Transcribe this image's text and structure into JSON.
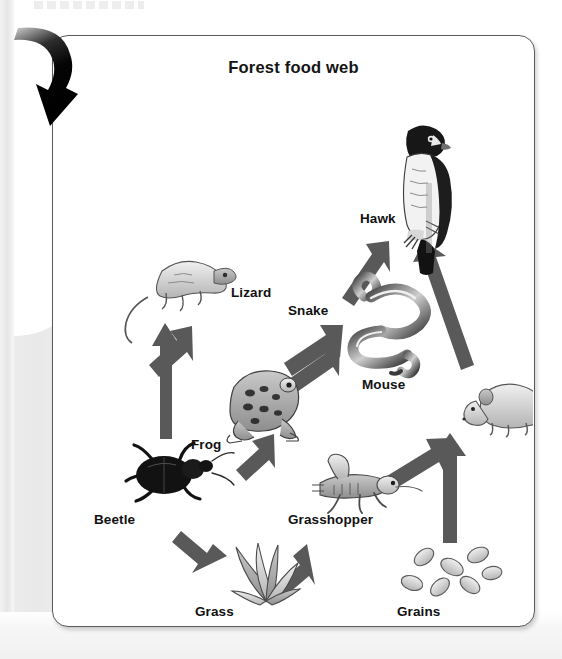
{
  "page": {
    "background_color": "#ffffff",
    "edge_shade_color": "#e9e9e9",
    "faint_header_text": ""
  },
  "annotation": {
    "arrow_name": "curved-callout-arrow",
    "color": "#0b0b0b",
    "direction": "down-right"
  },
  "card": {
    "title": "Forest food web",
    "border_color": "#5a5a5a",
    "background_color": "#ffffff"
  },
  "diagram": {
    "type": "food-web",
    "arrow_color": "#595959",
    "arrow_meaning": "energy flows in the direction of the arrow (eaten by)",
    "nodes": [
      {
        "id": "hawk",
        "label": "Hawk",
        "trophic": "tertiary consumer",
        "label_x": 308,
        "label_y": 183,
        "art_x": 348,
        "art_y": 92,
        "art_w": 66,
        "art_h": 122
      },
      {
        "id": "lizard",
        "label": "Lizard",
        "trophic": "secondary consumer",
        "label_x": 179,
        "label_y": 257,
        "art_x": 95,
        "art_y": 222,
        "art_w": 88,
        "art_h": 68
      },
      {
        "id": "snake",
        "label": "Snake",
        "trophic": "secondary consumer",
        "label_x": 258,
        "label_y": 275,
        "art_x": 300,
        "art_y": 252,
        "art_w": 84,
        "art_h": 86
      },
      {
        "id": "mouse",
        "label": "Mouse",
        "trophic": "primary consumer",
        "label_x": 362,
        "label_y": 349,
        "art_x": 414,
        "art_y": 338,
        "art_w": 84,
        "art_h": 62
      },
      {
        "id": "frog",
        "label": "Frog",
        "trophic": "secondary consumer",
        "label_x": 191,
        "label_y": 409,
        "art_x": 170,
        "art_y": 334,
        "art_w": 78,
        "art_h": 72
      },
      {
        "id": "beetle",
        "label": "Beetle",
        "trophic": "primary consumer",
        "label_x": 95,
        "label_y": 484,
        "art_x": 78,
        "art_y": 406,
        "art_w": 96,
        "art_h": 68
      },
      {
        "id": "grasshopper",
        "label": "Grasshopper",
        "trophic": "primary consumer",
        "label_x": 289,
        "label_y": 484,
        "art_x": 258,
        "art_y": 424,
        "art_w": 92,
        "art_h": 52
      },
      {
        "id": "grass",
        "label": "Grass",
        "trophic": "producer",
        "label_x": 196,
        "label_y": 576,
        "art_x": 178,
        "art_y": 510,
        "art_w": 72,
        "art_h": 62
      },
      {
        "id": "grains",
        "label": "Grains",
        "trophic": "producer",
        "label_x": 398,
        "label_y": 576,
        "art_x": 398,
        "art_y": 514,
        "art_w": 78,
        "art_h": 56
      }
    ],
    "links": [
      {
        "from": "grass",
        "to": "beetle"
      },
      {
        "from": "grass",
        "to": "grasshopper"
      },
      {
        "from": "grains",
        "to": "mouse"
      },
      {
        "from": "grasshopper",
        "to": "mouse"
      },
      {
        "from": "grasshopper",
        "to": "frog"
      },
      {
        "from": "beetle",
        "to": "lizard"
      },
      {
        "from": "frog",
        "to": "lizard"
      },
      {
        "from": "frog",
        "to": "snake"
      },
      {
        "from": "mouse",
        "to": "snake"
      },
      {
        "from": "snake",
        "to": "hawk"
      },
      {
        "from": "mouse",
        "to": "hawk"
      }
    ]
  }
}
